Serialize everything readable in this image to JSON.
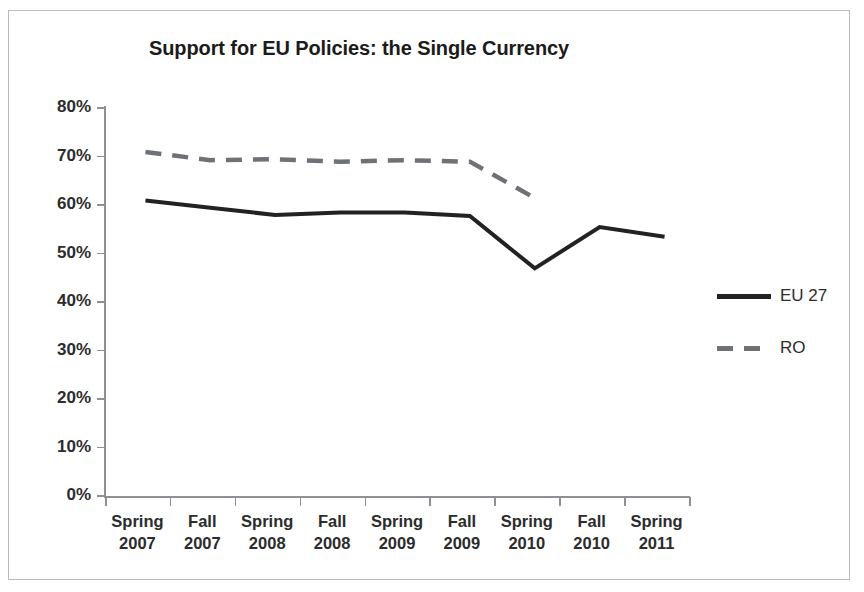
{
  "chart_data": {
    "type": "line",
    "title": "Support for EU Policies: the Single Currency",
    "xlabel": "",
    "ylabel": "",
    "ylim": [
      0,
      80
    ],
    "y_ticks": [
      0,
      10,
      20,
      30,
      40,
      50,
      60,
      70,
      80
    ],
    "y_tick_labels": [
      "0%",
      "10%",
      "20%",
      "30%",
      "40%",
      "50%",
      "60%",
      "70%",
      "80%"
    ],
    "grid": false,
    "legend_position": "right",
    "categories": [
      "Spring 2007",
      "Fall 2007",
      "Spring 2008",
      "Fall 2008",
      "Spring 2009",
      "Fall 2009",
      "Spring 2010",
      "Fall 2010",
      "Spring 2011"
    ],
    "category_lines": [
      [
        "Spring",
        "2007"
      ],
      [
        "Fall",
        "2007"
      ],
      [
        "Spring",
        "2008"
      ],
      [
        "Fall",
        "2008"
      ],
      [
        "Spring",
        "2009"
      ],
      [
        "Fall",
        "2009"
      ],
      [
        "Spring",
        "2010"
      ],
      [
        "Fall",
        "2010"
      ],
      [
        "Spring",
        "2011"
      ]
    ],
    "series": [
      {
        "name": "EU 27",
        "style": "solid",
        "color": "#222222",
        "values": [
          63,
          61.5,
          60,
          60.5,
          60.5,
          59.8,
          49,
          57.5,
          55.5
        ]
      },
      {
        "name": "RO",
        "style": "dashed",
        "color": "#6e7277",
        "values": [
          73,
          71.3,
          71.5,
          71,
          71.3,
          71,
          63.5,
          null,
          null
        ]
      }
    ]
  },
  "legend": {
    "entries": [
      {
        "label": "EU 27",
        "style": "solid"
      },
      {
        "label": "RO",
        "style": "dashed"
      }
    ]
  }
}
